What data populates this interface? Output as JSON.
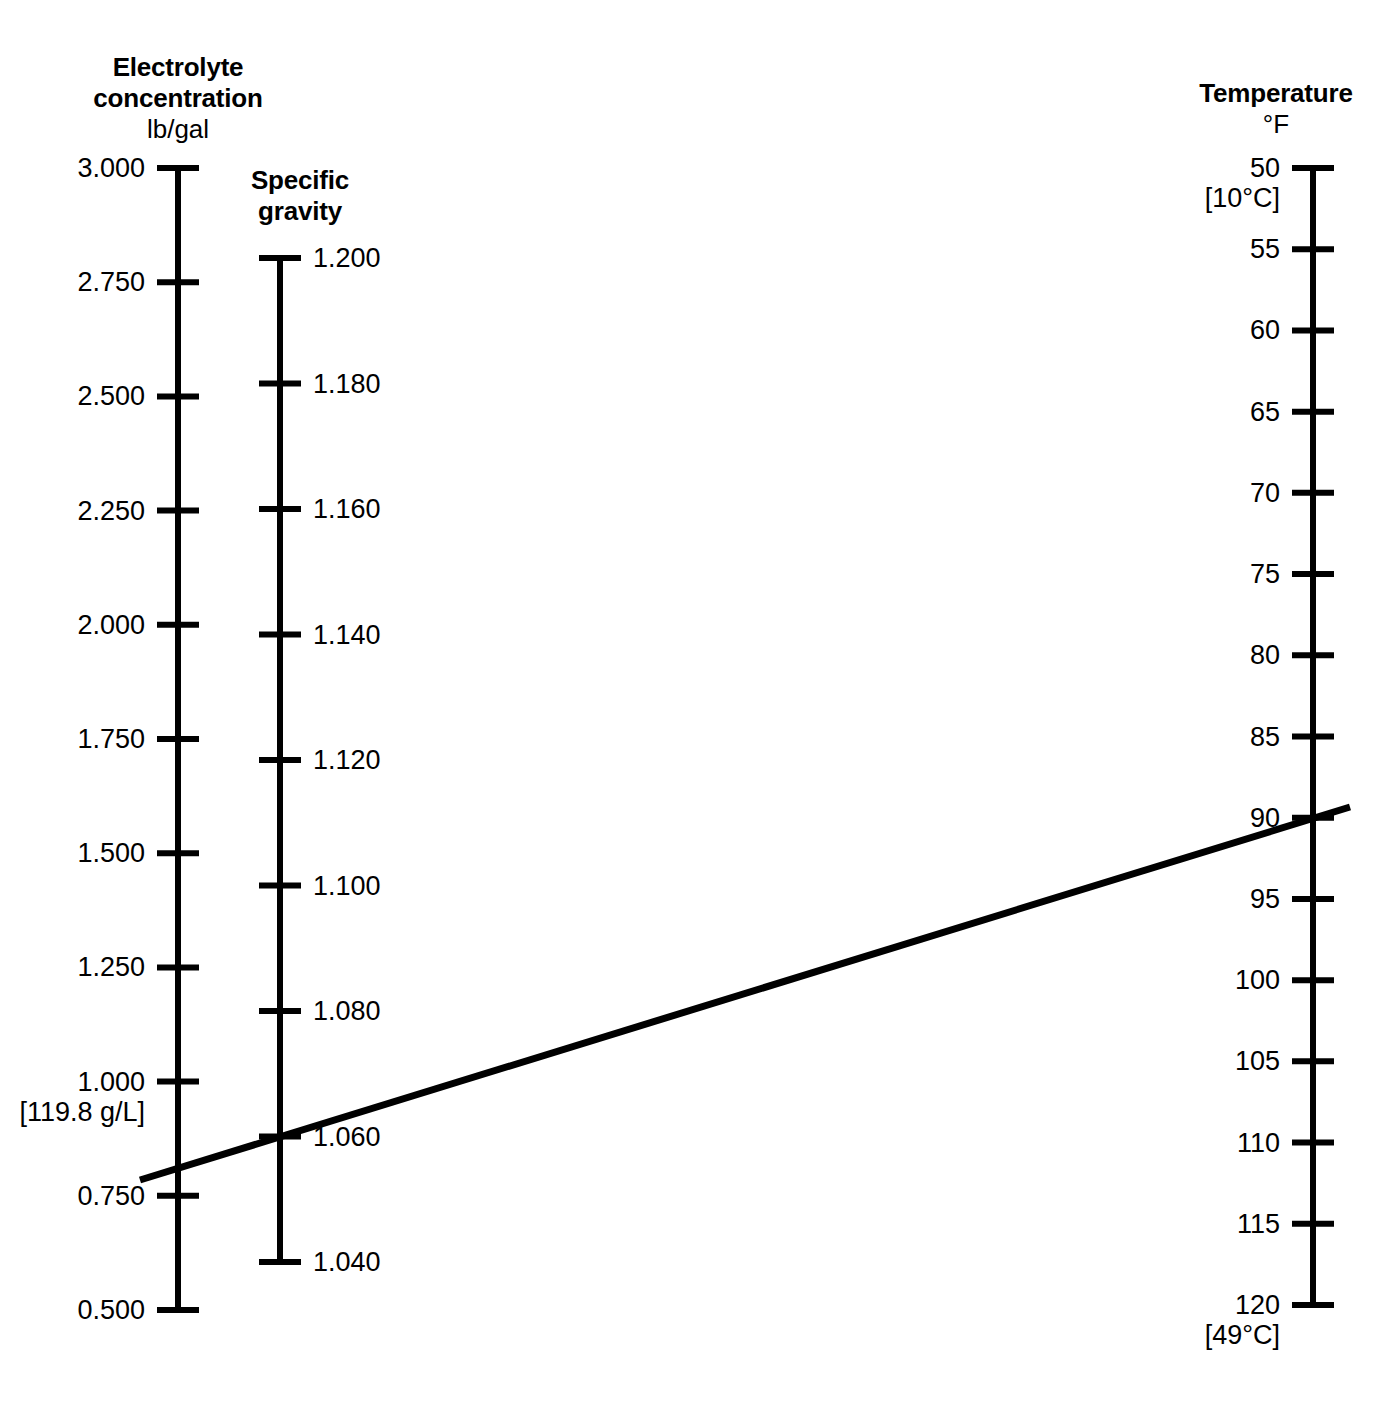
{
  "figure": {
    "kind": "nomogram",
    "background_color": "#ffffff",
    "ink_color": "#000000"
  },
  "chart_data": {
    "type": "line",
    "title": "",
    "subtitle": "",
    "xlabel": "",
    "ylabel": "",
    "grid": false,
    "legend": "none",
    "axes": [
      {
        "id": "electrolyte-concentration",
        "title": "Electrolyte\nconcentration",
        "unit": "lb/gal",
        "position": "left",
        "label_side": "left",
        "ticks": [
          "3.000",
          "2.750",
          "2.500",
          "2.250",
          "2.000",
          "1.750",
          "1.500",
          "1.250",
          "1.000",
          "0.750",
          "0.500"
        ],
        "values": [
          3.0,
          2.75,
          2.5,
          2.25,
          2.0,
          1.75,
          1.5,
          1.25,
          1.0,
          0.75,
          0.5
        ],
        "range": [
          0.5,
          3.0
        ],
        "bracket_notes": [
          {
            "after_tick": "1.000",
            "text": "[119.8 g/L]"
          }
        ]
      },
      {
        "id": "specific-gravity",
        "title": "Specific\ngravity",
        "unit": "",
        "position": "center",
        "label_side": "right",
        "ticks": [
          "1.200",
          "1.180",
          "1.160",
          "1.140",
          "1.120",
          "1.100",
          "1.080",
          "1.060",
          "1.040"
        ],
        "values": [
          1.2,
          1.18,
          1.16,
          1.14,
          1.12,
          1.1,
          1.08,
          1.06,
          1.04
        ],
        "range": [
          1.04,
          1.2
        ],
        "bracket_notes": []
      },
      {
        "id": "temperature",
        "title": "Temperature",
        "unit": "°F",
        "position": "right",
        "label_side": "left",
        "ticks": [
          "50",
          "55",
          "60",
          "65",
          "70",
          "75",
          "80",
          "85",
          "90",
          "95",
          "100",
          "105",
          "110",
          "115",
          "120"
        ],
        "values": [
          50,
          55,
          60,
          65,
          70,
          75,
          80,
          85,
          90,
          95,
          100,
          105,
          110,
          115,
          120
        ],
        "range": [
          50,
          120
        ],
        "bracket_notes": [
          {
            "after_tick": "50",
            "text": "[10°C]"
          },
          {
            "after_tick": "120",
            "text": "[49°C]"
          }
        ]
      }
    ],
    "index_line": {
      "name": "index-line",
      "readings": {
        "electrolyte_concentration_lb_per_gal": 0.79,
        "specific_gravity": 1.06,
        "temperature_f": 90
      },
      "stroke_width_px": 7
    }
  },
  "geometry": {
    "left_axis": {
      "x": 178,
      "y_top": 168,
      "y_bottom": 1310,
      "tick_half_width": 21,
      "line_width": 6
    },
    "mid_axis": {
      "x": 280,
      "y_top": 258,
      "y_bottom": 1262,
      "tick_half_width": 21,
      "line_width": 6
    },
    "right_axis": {
      "x": 1313,
      "y_top": 168,
      "y_bottom": 1305,
      "tick_half_width": 21,
      "line_width": 6
    },
    "index_line": {
      "x1": 140,
      "y1": 1180,
      "x2": 1350,
      "y2": 807
    },
    "titles": {
      "left": {
        "x": 178,
        "y": 52
      },
      "mid": {
        "x": 300,
        "y": 165
      },
      "right": {
        "x": 1276,
        "y": 78
      }
    }
  }
}
